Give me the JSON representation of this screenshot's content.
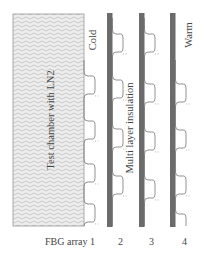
{
  "diagram": {
    "chamber_label": "Test chamber with LN2",
    "cold_label": "Cold",
    "insulation_label": "Multi layer insulation",
    "warm_label": "Warm",
    "array_labels": [
      "FBG array 1",
      "2",
      "3",
      "4"
    ],
    "colors": {
      "chamber_fill": "#e9e9e9",
      "chamber_hatch": "#bdbdbd",
      "chamber_border": "#9a9a9a",
      "insulation_bar": "#6b6b6b",
      "fiber_line": "#777777",
      "text": "#444444"
    }
  }
}
